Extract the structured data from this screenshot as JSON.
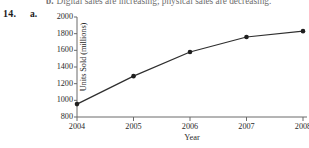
{
  "page": {
    "previous_item_text": "Digital sales are increasing; physical sales are decreasing.",
    "previous_item_bullet": "b.",
    "problem_number": "14.",
    "part_letter": "a."
  },
  "chart_data": {
    "type": "line",
    "title": "",
    "xlabel": "Year",
    "ylabel": "Units Sold (millions)",
    "categories": [
      "2004",
      "2005",
      "2006",
      "2007",
      "2008"
    ],
    "x": [
      2004,
      2005,
      2006,
      2007,
      2008
    ],
    "values": [
      955,
      1290,
      1580,
      1760,
      1830
    ],
    "series": [
      {
        "name": "Units Sold",
        "values": [
          955,
          1290,
          1580,
          1760,
          1830
        ]
      }
    ],
    "ylim": [
      800,
      2000
    ],
    "xlim": [
      2004,
      2008
    ],
    "ytick_labels": [
      "800",
      "1000",
      "1200",
      "1400",
      "1600",
      "1800",
      "2000"
    ],
    "ytick_values": [
      800,
      1000,
      1200,
      1400,
      1600,
      1800,
      2000
    ],
    "xtick_labels": [
      "2004",
      "2005",
      "2006",
      "2007",
      "2008"
    ],
    "grid": false,
    "legend": false,
    "marker": "filled-circle",
    "line_color": "#2e2e2e",
    "marker_color": "#1f1f1f",
    "axis_color": "#6a6a6a"
  }
}
